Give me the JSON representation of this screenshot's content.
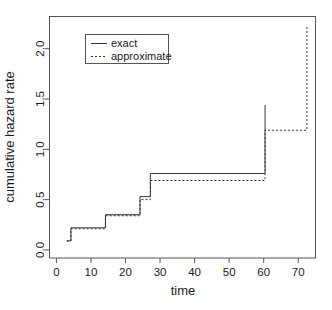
{
  "chart_data": {
    "type": "line",
    "subtype": "step",
    "title": "",
    "xlabel": "time",
    "ylabel": "cumulative hazard rate",
    "xlim": [
      -2,
      75
    ],
    "ylim": [
      -0.08,
      2.32
    ],
    "xticks": [
      0,
      10,
      20,
      30,
      40,
      50,
      60,
      70
    ],
    "xticklabels": [
      "0",
      "10",
      "20",
      "30",
      "40",
      "50",
      "60",
      "70"
    ],
    "yticks": [
      0.0,
      0.5,
      1.0,
      1.5,
      2.0
    ],
    "yticklabels": [
      "0.0",
      "0.5",
      "1.0",
      "1.5",
      "2.0"
    ],
    "grid": false,
    "legend": {
      "position": "top-left",
      "entries": [
        {
          "name": "exact",
          "style": "solid"
        },
        {
          "name": "approximate",
          "style": "dashed"
        }
      ]
    },
    "series": [
      {
        "name": "exact",
        "style": "solid",
        "color": "#333333",
        "x": [
          3.0,
          4.2,
          4.2,
          14.2,
          14.2,
          24.2,
          24.2,
          27.2,
          27.2,
          60.4,
          60.4
        ],
        "y": [
          0.09,
          0.09,
          0.22,
          0.22,
          0.35,
          0.35,
          0.53,
          0.53,
          0.76,
          0.76,
          1.44
        ]
      },
      {
        "name": "approximate",
        "style": "dashed",
        "color": "#333333",
        "x": [
          3.0,
          4.2,
          4.2,
          14.2,
          14.2,
          24.2,
          24.2,
          27.2,
          27.2,
          60.4,
          60.4,
          72.5,
          72.5
        ],
        "y": [
          0.09,
          0.09,
          0.21,
          0.21,
          0.34,
          0.34,
          0.5,
          0.5,
          0.69,
          0.69,
          1.19,
          1.19,
          2.22
        ]
      }
    ],
    "annotations": []
  },
  "axis": {
    "x_title": "time",
    "y_title": "cumulative hazard rate"
  },
  "legend": {
    "exact_label": "exact",
    "approximate_label": "approximate"
  }
}
